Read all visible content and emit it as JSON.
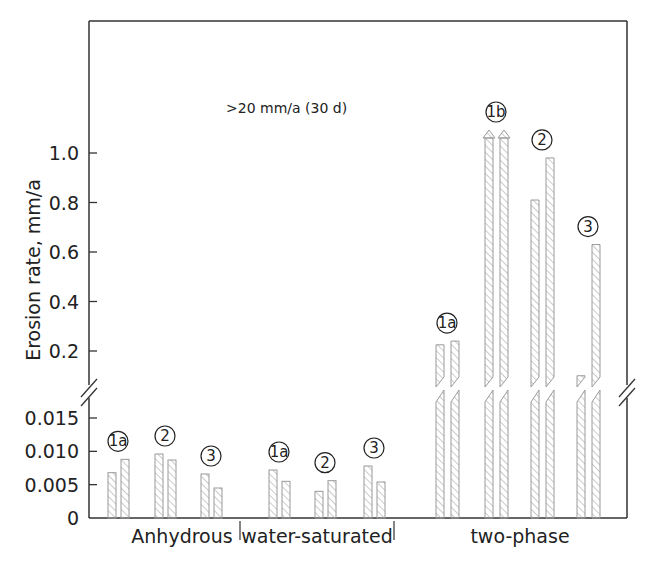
{
  "chart_data": {
    "type": "bar",
    "title": "",
    "xlabel": "",
    "ylabel": "Erosion rate, mm/a",
    "annotation": ">20 mm/a (30 d)",
    "broken_axis": true,
    "lower_axis": {
      "ylim": [
        0,
        0.018
      ],
      "ticks": [
        "0",
        "0.005",
        "0.010",
        "0.015"
      ],
      "tick_values": [
        0,
        0.005,
        0.01,
        0.015
      ]
    },
    "upper_axis": {
      "ylim": [
        0.1,
        1.1
      ],
      "ticks": [
        "0.2",
        "0.4",
        "0.6",
        "0.8",
        "1.0"
      ],
      "tick_values": [
        0.2,
        0.4,
        0.6,
        0.8,
        1.0
      ]
    },
    "categories": [
      "Anhydrous",
      "water-saturated",
      "two-phase"
    ],
    "groups": [
      {
        "category": "Anhydrous",
        "label": "1a",
        "values": [
          0.0068,
          0.0088
        ]
      },
      {
        "category": "Anhydrous",
        "label": "2",
        "values": [
          0.0096,
          0.0087
        ]
      },
      {
        "category": "Anhydrous",
        "label": "3",
        "values": [
          0.0066,
          0.0045
        ]
      },
      {
        "category": "water-saturated",
        "label": "1a",
        "values": [
          0.0072,
          0.0055
        ]
      },
      {
        "category": "water-saturated",
        "label": "2",
        "values": [
          0.004,
          0.0056
        ]
      },
      {
        "category": "water-saturated",
        "label": "3",
        "values": [
          0.0078,
          0.0054
        ]
      },
      {
        "category": "two-phase",
        "label": "1a",
        "values": [
          0.225,
          0.24
        ]
      },
      {
        "category": "two-phase",
        "label": "1b",
        "values": [
          ">20",
          ">20"
        ],
        "exceeds_scale": true
      },
      {
        "category": "two-phase",
        "label": "2",
        "values": [
          0.81,
          0.98
        ]
      },
      {
        "category": "two-phase",
        "label": "3",
        "values": [
          0.1,
          0.63
        ]
      }
    ],
    "colors": {
      "axis": "#333333",
      "bar_stroke": "#9a9a9a",
      "hatch": "#a0a0a0"
    }
  }
}
